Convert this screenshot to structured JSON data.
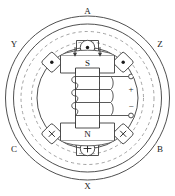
{
  "diagram": {
    "colors": {
      "line": "#3c3c3c",
      "dashed": "#8c8c8c",
      "text": "#1a1a1a",
      "background": "#ffffff"
    },
    "stator": {
      "name": "stator-ring",
      "outer_radius": 82,
      "mid_radius": 74,
      "dashed_radius": 67,
      "inner_radius": 58,
      "bore_radius": 50
    },
    "rotor": {
      "pole_top_label": "S",
      "pole_bottom_label": "N",
      "terminal_positive": "+",
      "terminal_negative": "−",
      "coil_turns": 4
    },
    "slots": [
      {
        "label": "A",
        "symbol": "dot",
        "angle_deg": 90,
        "label_pos": "top"
      },
      {
        "label": "Z",
        "symbol": "dot",
        "angle_deg": 45,
        "label_pos": "upper-right"
      },
      {
        "label": "B",
        "symbol": "cross",
        "angle_deg": 315,
        "label_pos": "lower-right"
      },
      {
        "label": "X",
        "symbol": "plus",
        "angle_deg": 270,
        "label_pos": "bottom"
      },
      {
        "label": "C",
        "symbol": "cross",
        "angle_deg": 225,
        "label_pos": "lower-left"
      },
      {
        "label": "Y",
        "symbol": "dot",
        "angle_deg": 135,
        "label_pos": "upper-left"
      }
    ]
  }
}
